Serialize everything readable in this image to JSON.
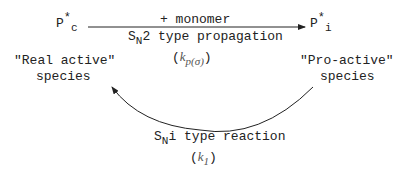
{
  "left_species": {
    "base": "P",
    "sup": "*",
    "sub": "c",
    "label_line1": "\"Real active\"",
    "label_line2": "species"
  },
  "right_species": {
    "base": "P",
    "sup": "*",
    "sub": "i",
    "label_line1": "\"Pro-active\"",
    "label_line2": "species"
  },
  "top_arrow": {
    "above": "+ monomer",
    "below_pre": "S",
    "below_sub": "N",
    "below_post": "2 type propagation",
    "rate_open": "(",
    "rate_k": "k",
    "rate_sub": "p(σ)",
    "rate_close": ")"
  },
  "bottom_arrow": {
    "label_pre": "S",
    "label_sub": "N",
    "label_post": "i type reaction",
    "rate_open": "(",
    "rate_k": "k",
    "rate_sub": "1",
    "rate_close": ")"
  },
  "colors": {
    "ink": "#222222",
    "background": "#ffffff"
  }
}
